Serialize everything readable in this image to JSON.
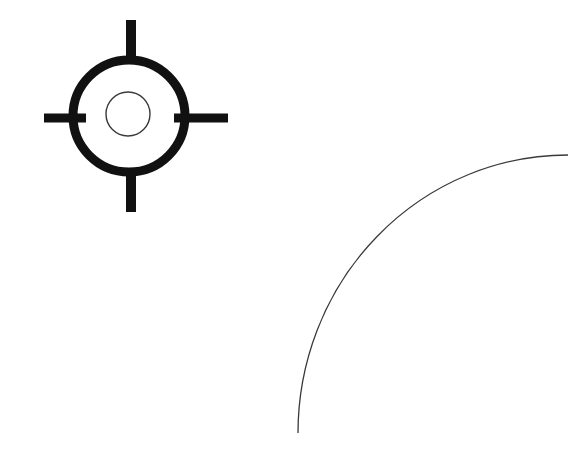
{
  "document": {
    "title": "Technical line drawing",
    "background_color": "#ffffff",
    "width": 586,
    "height": 450
  },
  "shapes": {
    "survey_marker": {
      "label": "Survey control point symbol",
      "stroke_color": "#111111",
      "center": {
        "x": 129,
        "y": 116
      },
      "outer_ring": {
        "label": "Outer heavy ring",
        "radius": 56,
        "stroke_width": 9
      },
      "inner_circle": {
        "label": "Inner thin circle",
        "center": {
          "x": 128,
          "y": 114
        },
        "radius": 22,
        "stroke_width": 1.4,
        "stroke_color": "#3a3a3a"
      },
      "ticks": [
        {
          "name": "tick-north",
          "x1": 131,
          "y1": 20,
          "x2": 131,
          "y2": 62,
          "stroke_width": 10
        },
        {
          "name": "tick-south",
          "x1": 131,
          "y1": 170,
          "x2": 131,
          "y2": 212,
          "stroke_width": 10
        },
        {
          "name": "tick-west",
          "x1": 44,
          "y1": 118,
          "x2": 86,
          "y2": 118,
          "stroke_width": 9
        },
        {
          "name": "tick-east",
          "x1": 174,
          "y1": 118,
          "x2": 228,
          "y2": 118,
          "stroke_width": 9
        }
      ]
    },
    "arc_curve": {
      "label": "Quarter arc curve",
      "stroke_color": "#3a3a3a",
      "stroke_width": 1.3,
      "start": {
        "x": 298,
        "y": 433
      },
      "end": {
        "x": 568,
        "y": 155
      },
      "center": {
        "x": 568,
        "y": 433
      },
      "radius_x": 270,
      "radius_y": 278,
      "path": "M 298 433 A 270 278 0 0 1 568 155"
    }
  }
}
